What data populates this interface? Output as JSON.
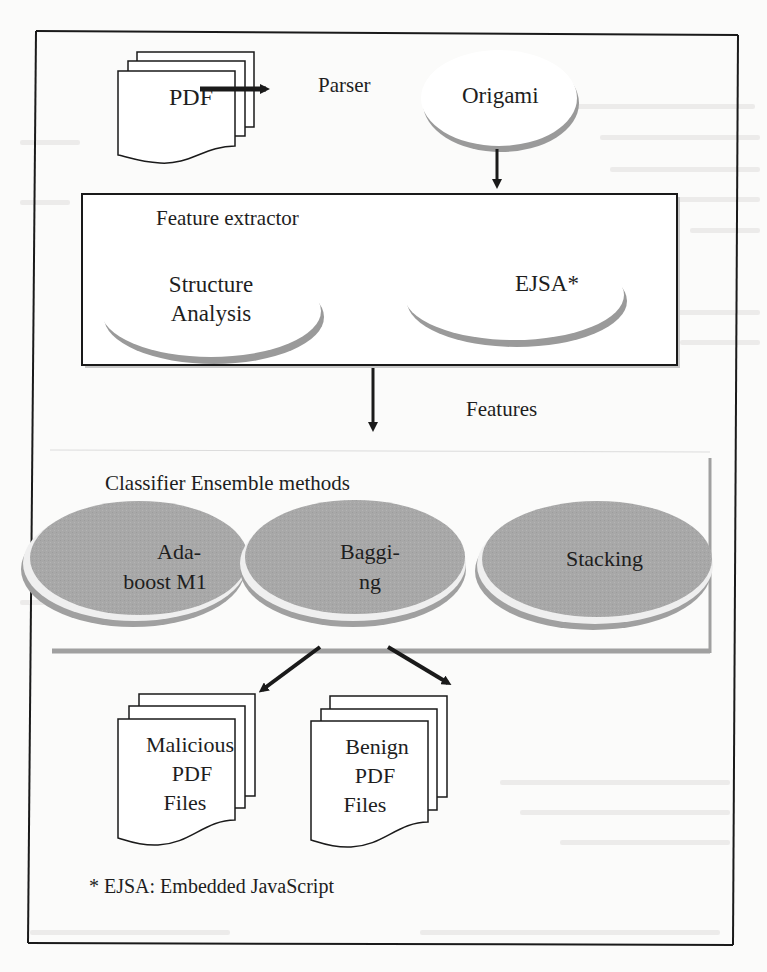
{
  "diagram": {
    "input": {
      "label": "PDF",
      "icon": "document-stack-icon"
    },
    "parser_edge": {
      "label": "Parser"
    },
    "parser_node": {
      "label": "Origami"
    },
    "feature_extractor": {
      "title": "Feature extractor",
      "nodes": [
        {
          "line1": "Structure",
          "line2": "Analysis"
        },
        {
          "line1": "EJSA*",
          "line2": ""
        }
      ]
    },
    "features_edge": {
      "label": "Features"
    },
    "classifier": {
      "title": "Classifier Ensemble methods",
      "methods": [
        {
          "line1": "Ada-",
          "line2": "boost M1"
        },
        {
          "line1": "Baggi-",
          "line2": "ng"
        },
        {
          "line1": "Stacking",
          "line2": ""
        }
      ]
    },
    "outputs": [
      {
        "line1": "Malicious",
        "line2": "PDF",
        "line3": "Files",
        "icon": "document-stack-icon"
      },
      {
        "line1": "Benign",
        "line2": "PDF",
        "line3": "Files",
        "icon": "document-stack-icon"
      }
    ],
    "footnote": "* EJSA: Embedded JavaScript",
    "colors": {
      "line": "#1a1a1a",
      "ellipse_light": "#ffffff",
      "ellipse_shadow": "#9a9a9a",
      "ellipse_dark": "#a9a9a9",
      "background": "#fbfbfa"
    }
  }
}
